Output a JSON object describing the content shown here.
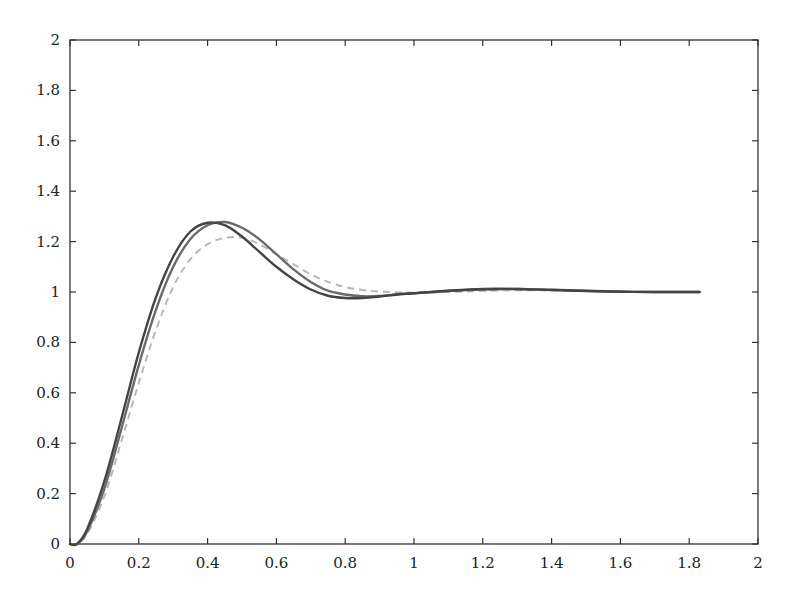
{
  "chart_data": {
    "type": "line",
    "title": "",
    "xlabel": "",
    "ylabel": "",
    "xlim": [
      0,
      2
    ],
    "ylim": [
      0,
      2
    ],
    "grid": false,
    "legend": null,
    "x_ticks": [
      "0",
      "0.2",
      "0.4",
      "0.6",
      "0.8",
      "1",
      "1.2",
      "1.4",
      "1.6",
      "1.8",
      "2"
    ],
    "y_ticks": [
      "0",
      "0.2",
      "0.4",
      "0.6",
      "0.8",
      "1",
      "1.2",
      "1.4",
      "1.6",
      "1.8",
      "2"
    ],
    "x": [
      0.0,
      0.02,
      0.05,
      0.1,
      0.15,
      0.2,
      0.25,
      0.3,
      0.35,
      0.4,
      0.45,
      0.5,
      0.55,
      0.6,
      0.65,
      0.7,
      0.75,
      0.8,
      0.85,
      0.9,
      0.95,
      1.0,
      1.1,
      1.2,
      1.3,
      1.4,
      1.5,
      1.6,
      1.7,
      1.83
    ],
    "series": [
      {
        "name": "response-1 (dark solid)",
        "color": "#444444",
        "style": "solid",
        "values": [
          0.0,
          0.0,
          0.06,
          0.25,
          0.5,
          0.76,
          0.98,
          1.14,
          1.24,
          1.275,
          1.265,
          1.22,
          1.16,
          1.1,
          1.05,
          1.01,
          0.985,
          0.976,
          0.976,
          0.982,
          0.99,
          0.995,
          1.005,
          1.012,
          1.012,
          1.008,
          1.004,
          1.001,
          1.0,
          1.0
        ]
      },
      {
        "name": "response-2 (gray solid)",
        "color": "#6a6a6a",
        "style": "solid",
        "values": [
          0.0,
          0.0,
          0.05,
          0.22,
          0.46,
          0.71,
          0.93,
          1.1,
          1.21,
          1.265,
          1.278,
          1.255,
          1.21,
          1.15,
          1.09,
          1.04,
          1.005,
          0.99,
          0.983,
          0.984,
          0.99,
          0.995,
          1.004,
          1.01,
          1.012,
          1.009,
          1.005,
          1.002,
          1.0,
          1.0
        ]
      },
      {
        "name": "response-3 (light dashed)",
        "color": "#b8b8b8",
        "style": "dashed",
        "values": [
          0.0,
          0.0,
          0.04,
          0.19,
          0.41,
          0.64,
          0.85,
          1.02,
          1.13,
          1.19,
          1.215,
          1.215,
          1.19,
          1.15,
          1.11,
          1.07,
          1.04,
          1.02,
          1.008,
          1.002,
          0.999,
          0.998,
          1.0,
          1.004,
          1.007,
          1.006,
          1.004,
          1.002,
          1.0,
          1.0
        ]
      }
    ]
  }
}
